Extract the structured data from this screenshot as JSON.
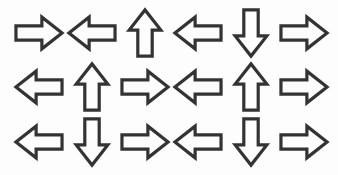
{
  "canvas": {
    "width": 338,
    "height": 175,
    "background_color": "#fdfdfd",
    "stroke_color": "#333333",
    "fill_color": "#fdfdfd"
  },
  "grid": {
    "rows": 3,
    "columns": 6,
    "total_arrows": 18
  },
  "arrows": [
    {
      "row": 1,
      "column": 1,
      "direction": "right",
      "icon": "arrow-right-icon"
    },
    {
      "row": 1,
      "column": 2,
      "direction": "left",
      "icon": "arrow-left-icon"
    },
    {
      "row": 1,
      "column": 3,
      "direction": "up",
      "icon": "arrow-up-icon"
    },
    {
      "row": 1,
      "column": 4,
      "direction": "left",
      "icon": "arrow-left-icon"
    },
    {
      "row": 1,
      "column": 5,
      "direction": "down",
      "icon": "arrow-down-icon"
    },
    {
      "row": 1,
      "column": 6,
      "direction": "right",
      "icon": "arrow-right-icon"
    },
    {
      "row": 2,
      "column": 1,
      "direction": "left",
      "icon": "arrow-left-icon"
    },
    {
      "row": 2,
      "column": 2,
      "direction": "up",
      "icon": "arrow-up-icon"
    },
    {
      "row": 2,
      "column": 3,
      "direction": "right",
      "icon": "arrow-right-icon"
    },
    {
      "row": 2,
      "column": 4,
      "direction": "left",
      "icon": "arrow-left-icon"
    },
    {
      "row": 2,
      "column": 5,
      "direction": "up",
      "icon": "arrow-up-icon"
    },
    {
      "row": 2,
      "column": 6,
      "direction": "right",
      "icon": "arrow-right-icon"
    },
    {
      "row": 3,
      "column": 1,
      "direction": "left",
      "icon": "arrow-left-icon"
    },
    {
      "row": 3,
      "column": 2,
      "direction": "down",
      "icon": "arrow-down-icon"
    },
    {
      "row": 3,
      "column": 3,
      "direction": "right",
      "icon": "arrow-right-icon"
    },
    {
      "row": 3,
      "column": 4,
      "direction": "left",
      "icon": "arrow-left-icon"
    },
    {
      "row": 3,
      "column": 5,
      "direction": "down",
      "icon": "arrow-down-icon"
    },
    {
      "row": 3,
      "column": 6,
      "direction": "right",
      "icon": "arrow-right-icon"
    }
  ],
  "shape_geometry": {
    "horizontal": {
      "viewbox": "0 0 100 74",
      "note": "block arrow pointing right; mirrored via scale(-1,1) for left",
      "points": "2,22 56,22 56,4 98,37 56,70 56,52 2,52"
    },
    "vertical": {
      "viewbox": "0 0 74 100",
      "note": "block arrow pointing up; mirrored via scale(1,-1) for down",
      "points": "22,98 22,44 4,44 37,2 70,44 52,44 52,98"
    }
  }
}
